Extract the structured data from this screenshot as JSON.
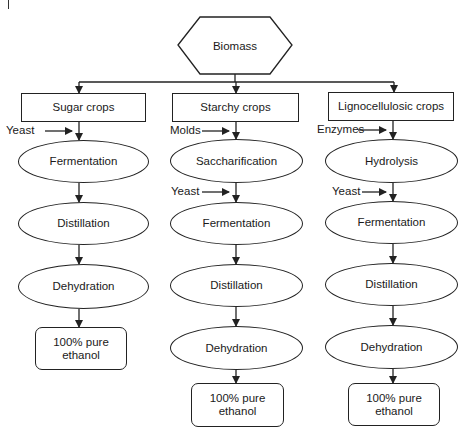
{
  "diagram": {
    "title_node": "Biomass",
    "columns": [
      {
        "source": "Sugar crops",
        "inputs": [
          {
            "label": "Yeast",
            "before_step": 0
          }
        ],
        "steps": [
          "Fermentation",
          "Distillation",
          "Dehydration"
        ],
        "product": [
          "100% pure",
          "ethanol"
        ]
      },
      {
        "source": "Starchy crops",
        "inputs": [
          {
            "label": "Molds",
            "before_step": 0
          },
          {
            "label": "Yeast",
            "before_step": 1
          }
        ],
        "steps": [
          "Saccharification",
          "Fermentation",
          "Distillation",
          "Dehydration"
        ],
        "product": [
          "100% pure",
          "ethanol"
        ]
      },
      {
        "source": "Lignocellulosic crops",
        "inputs": [
          {
            "label": "Enzymes",
            "before_step": 0
          },
          {
            "label": "Yeast",
            "before_step": 1
          }
        ],
        "steps": [
          "Hydrolysis",
          "Fermentation",
          "Distillation",
          "Dehydration"
        ],
        "product": [
          "100% pure",
          "ethanol"
        ]
      }
    ],
    "colors": {
      "stroke": "#222222",
      "background": "#ffffff"
    }
  }
}
